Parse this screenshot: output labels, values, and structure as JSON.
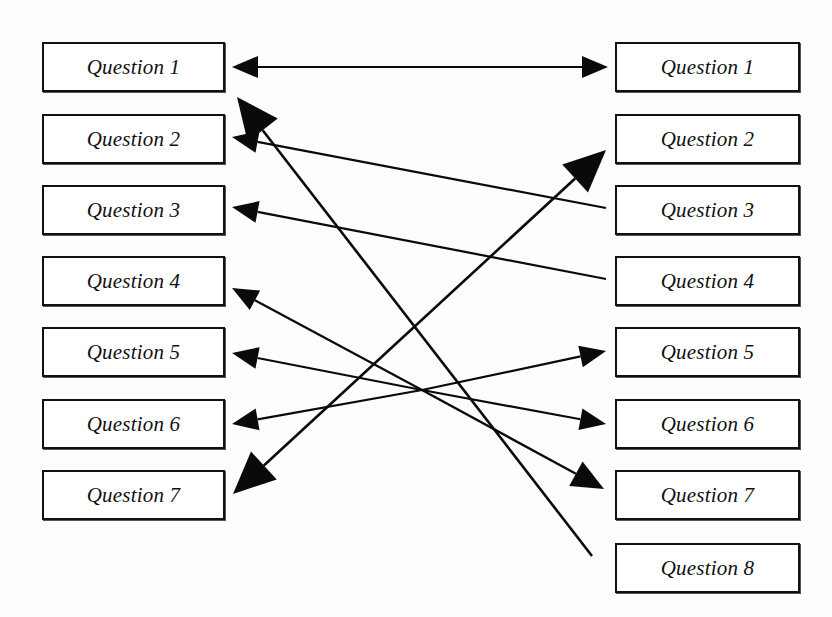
{
  "diagram": {
    "line_color": "#0a0a0a",
    "box_border_color": "#111111",
    "box_fill": "#ffffff",
    "background": "#fdfdfb"
  },
  "left_column": {
    "name": "left-question-list",
    "boxes": [
      {
        "label": "Question 1",
        "x": 42,
        "y": 42,
        "w": 183,
        "h": 50
      },
      {
        "label": "Question 2",
        "x": 42,
        "y": 114,
        "w": 183,
        "h": 50
      },
      {
        "label": "Question 3",
        "x": 42,
        "y": 185,
        "w": 183,
        "h": 50
      },
      {
        "label": "Question 4",
        "x": 42,
        "y": 256,
        "w": 183,
        "h": 50
      },
      {
        "label": "Question 5",
        "x": 42,
        "y": 327,
        "w": 183,
        "h": 50
      },
      {
        "label": "Question 6",
        "x": 42,
        "y": 399,
        "w": 183,
        "h": 50
      },
      {
        "label": "Question 7",
        "x": 42,
        "y": 470,
        "w": 183,
        "h": 50
      }
    ]
  },
  "right_column": {
    "name": "right-question-list",
    "boxes": [
      {
        "label": "Question 1",
        "x": 615,
        "y": 42,
        "w": 185,
        "h": 50
      },
      {
        "label": "Question 2",
        "x": 615,
        "y": 114,
        "w": 185,
        "h": 50
      },
      {
        "label": "Question 3",
        "x": 615,
        "y": 185,
        "w": 185,
        "h": 50
      },
      {
        "label": "Question 4",
        "x": 615,
        "y": 256,
        "w": 185,
        "h": 50
      },
      {
        "label": "Question 5",
        "x": 615,
        "y": 327,
        "w": 185,
        "h": 50
      },
      {
        "label": "Question 6",
        "x": 615,
        "y": 399,
        "w": 185,
        "h": 50
      },
      {
        "label": "Question 7",
        "x": 615,
        "y": 470,
        "w": 185,
        "h": 50
      },
      {
        "label": "Question 8",
        "x": 615,
        "y": 543,
        "w": 185,
        "h": 50
      }
    ]
  },
  "connections": [
    {
      "name": "edge-left-q1-right-q1",
      "from": "left.Question 1",
      "to": "right.Question 1",
      "x1": 232,
      "y1": 67,
      "x2": 608,
      "y2": 67,
      "arrow_start": true,
      "arrow_end": true,
      "head": "small"
    },
    {
      "name": "edge-right-q8-left-q1",
      "from": "right.Question 8",
      "to": "left.Question 1",
      "x1": 592,
      "y1": 556,
      "x2": 237,
      "y2": 97,
      "arrow_start": false,
      "arrow_end": true,
      "head": "large"
    },
    {
      "name": "edge-right-q3-left-q2",
      "from": "right.Question 3",
      "to": "left.Question 2",
      "x1": 606,
      "y1": 208,
      "x2": 232,
      "y2": 137,
      "arrow_start": false,
      "arrow_end": true,
      "head": "small"
    },
    {
      "name": "edge-right-q4-left-q3",
      "from": "right.Question 4",
      "to": "left.Question 3",
      "x1": 606,
      "y1": 279,
      "x2": 232,
      "y2": 207,
      "arrow_start": false,
      "arrow_end": true,
      "head": "small"
    },
    {
      "name": "edge-left-q7-right-q2",
      "from": "left.Question 7",
      "to": "right.Question 2",
      "x1": 233,
      "y1": 494,
      "x2": 606,
      "y2": 150,
      "arrow_start": true,
      "arrow_end": true,
      "head": "large"
    },
    {
      "name": "edge-hub-left-q4",
      "from": "hub",
      "to": "left.Question 4",
      "x1": 422,
      "y1": 390,
      "x2": 232,
      "y2": 288,
      "arrow_start": false,
      "arrow_end": true,
      "head": "small"
    },
    {
      "name": "edge-hub-left-q5",
      "from": "hub",
      "to": "left.Question 5",
      "x1": 422,
      "y1": 390,
      "x2": 232,
      "y2": 353,
      "arrow_start": false,
      "arrow_end": true,
      "head": "small"
    },
    {
      "name": "edge-hub-left-q6",
      "from": "hub",
      "to": "left.Question 6",
      "x1": 422,
      "y1": 390,
      "x2": 232,
      "y2": 424,
      "arrow_start": false,
      "arrow_end": true,
      "head": "small"
    },
    {
      "name": "edge-hub-right-q5",
      "from": "hub",
      "to": "right.Question 5",
      "x1": 422,
      "y1": 390,
      "x2": 606,
      "y2": 351,
      "arrow_start": false,
      "arrow_end": true,
      "head": "small"
    },
    {
      "name": "edge-hub-right-q6",
      "from": "hub",
      "to": "right.Question 6",
      "x1": 422,
      "y1": 390,
      "x2": 606,
      "y2": 424,
      "arrow_start": false,
      "arrow_end": true,
      "head": "small"
    },
    {
      "name": "edge-hub-right-q7",
      "from": "hub",
      "to": "right.Question 7",
      "x1": 422,
      "y1": 390,
      "x2": 604,
      "y2": 489,
      "arrow_start": false,
      "arrow_end": true,
      "head": "medium"
    }
  ]
}
